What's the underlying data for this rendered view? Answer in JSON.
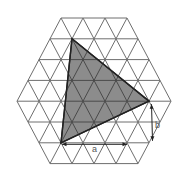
{
  "diagram": {
    "lattice": {
      "shape": "regular hexagon",
      "hexagon_side_segments": {
        "top": 3,
        "middle_row": 7,
        "bottom": 4
      },
      "rows_above_middle": 4,
      "rows_below_middle": 3
    },
    "shaded_triangle": {
      "vertices_lattice": [
        {
          "row": 1,
          "col": 1,
          "name": "top"
        },
        {
          "row": 4,
          "col": 6,
          "name": "right"
        },
        {
          "row": 6,
          "col": 1,
          "name": "bottom-left"
        }
      ],
      "fill_color": "#8c8c8c",
      "edge_color": "#222222"
    },
    "dimensions": [
      {
        "label": "a",
        "segments": 3,
        "direction": "horizontal",
        "along": "below bottom-left vertex"
      },
      {
        "label": "b",
        "segments": 2,
        "direction": "lattice diagonal",
        "along": "below right vertex"
      }
    ],
    "colors": {
      "grid": "#6e6e6e",
      "label_text": "#555555"
    }
  }
}
